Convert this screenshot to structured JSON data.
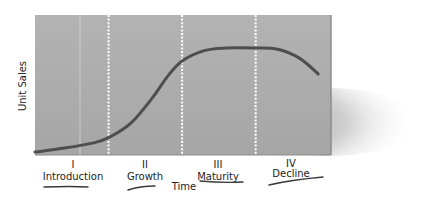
{
  "chart_data": {
    "type": "line",
    "title": "",
    "xlabel": "Time",
    "ylabel": "Unit Sales",
    "grid": false,
    "legend": "none",
    "stages": [
      {
        "numeral": "I",
        "name": "Introduction"
      },
      {
        "numeral": "II",
        "name": "Growth"
      },
      {
        "numeral": "III",
        "name": "Maturity"
      },
      {
        "numeral": "IV",
        "name": "Decline"
      }
    ],
    "stage_boundaries": [
      1,
      2,
      3
    ],
    "xlim": [
      0,
      4
    ],
    "ylim": [
      0,
      1
    ],
    "series": [
      {
        "name": "Unit Sales",
        "x": [
          0,
          0.4,
          0.8,
          1.0,
          1.3,
          1.6,
          1.8,
          2.0,
          2.3,
          2.6,
          3.0,
          3.3,
          3.6,
          3.85
        ],
        "values": [
          0.0,
          0.03,
          0.07,
          0.11,
          0.22,
          0.42,
          0.58,
          0.7,
          0.78,
          0.8,
          0.8,
          0.79,
          0.72,
          0.6
        ]
      }
    ]
  },
  "colors": {
    "panel": "#a9a9a9",
    "panel_edge": "#8f8f8f",
    "curve": "#4e4e4e",
    "divider": "#ffffff",
    "text": "#222222",
    "underline": "#3a3a3a",
    "shadow": "#6b6b6b"
  }
}
